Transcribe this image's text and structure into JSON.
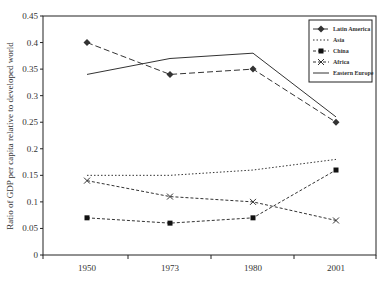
{
  "chart_data": {
    "type": "line",
    "title": "",
    "xlabel": "",
    "ylabel": "Ratio of GDP per capita relative to developed world",
    "categories": [
      "1950",
      "1973",
      "1980",
      "2001"
    ],
    "ylim": [
      0,
      0.45
    ],
    "yticks": [
      "0",
      "0.05",
      "0.1",
      "0.15",
      "0.2",
      "0.25",
      "0.3",
      "0.35",
      "0.4",
      "0.45"
    ],
    "grid": false,
    "legend_position": "upper right inside",
    "series": [
      {
        "name": "Latin America",
        "values": [
          0.4,
          0.34,
          0.35,
          0.25
        ],
        "style": "dashed",
        "marker": "diamond"
      },
      {
        "name": "Asia",
        "values": [
          0.15,
          0.15,
          0.16,
          0.18
        ],
        "style": "dotted",
        "marker": "none"
      },
      {
        "name": "China",
        "values": [
          0.07,
          0.06,
          0.07,
          0.16
        ],
        "style": "dash-dot",
        "marker": "square"
      },
      {
        "name": "Africa",
        "values": [
          0.14,
          0.11,
          0.1,
          0.065
        ],
        "style": "dash-dot",
        "marker": "x"
      },
      {
        "name": "Eastern Europe",
        "values": [
          0.34,
          0.37,
          0.38,
          0.26
        ],
        "style": "solid",
        "marker": "none"
      }
    ]
  },
  "colors": {
    "line": "#333333",
    "axis": "#222222"
  }
}
